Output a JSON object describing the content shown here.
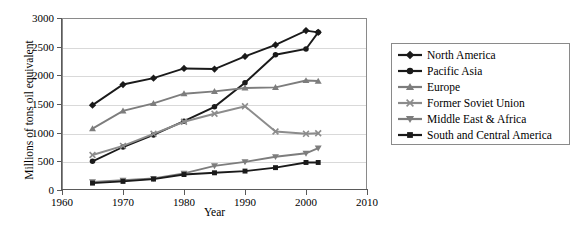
{
  "chart_data": {
    "type": "line",
    "title": "",
    "xlabel": "Year",
    "ylabel": "Millions of tons oil equivalent",
    "xlim": [
      1960,
      2010
    ],
    "ylim": [
      0,
      3000
    ],
    "xticks": [
      1960,
      1970,
      1980,
      1990,
      2000,
      2010
    ],
    "yticks": [
      0,
      500,
      1000,
      1500,
      2000,
      2500,
      3000
    ],
    "grid": "horizontal",
    "legend_position": "right",
    "x": [
      1965,
      1970,
      1975,
      1980,
      1985,
      1990,
      1995,
      2000,
      2002
    ],
    "series": [
      {
        "name": "North America",
        "marker": "diamond",
        "color": "#1a1a1a",
        "values": [
          1480,
          1840,
          1950,
          2120,
          2110,
          2330,
          2530,
          2780,
          2750
        ]
      },
      {
        "name": "Pacific Asia",
        "marker": "circle",
        "color": "#1a1a1a",
        "values": [
          500,
          750,
          960,
          1200,
          1450,
          1870,
          2360,
          2460,
          2750
        ]
      },
      {
        "name": "Europe",
        "marker": "triangle-up",
        "color": "#7d7d7d",
        "values": [
          1070,
          1380,
          1510,
          1680,
          1720,
          1780,
          1790,
          1910,
          1900
        ]
      },
      {
        "name": "Former Soviet Union",
        "marker": "cross-x",
        "color": "#8c8c8c",
        "values": [
          610,
          770,
          980,
          1190,
          1330,
          1460,
          1020,
          980,
          990
        ]
      },
      {
        "name": "Middle East & Africa",
        "marker": "triangle-down",
        "color": "#7d7d7d",
        "values": [
          140,
          170,
          200,
          290,
          420,
          490,
          580,
          640,
          730
        ]
      },
      {
        "name": "South and Central America",
        "marker": "square",
        "color": "#1a1a1a",
        "values": [
          120,
          150,
          190,
          270,
          300,
          330,
          390,
          480,
          480
        ]
      }
    ]
  },
  "legend": {
    "items": [
      {
        "label": "North America"
      },
      {
        "label": "Pacific Asia"
      },
      {
        "label": "Europe"
      },
      {
        "label": "Former Soviet Union"
      },
      {
        "label": "Middle East & Africa"
      },
      {
        "label": "South and Central America"
      }
    ]
  }
}
